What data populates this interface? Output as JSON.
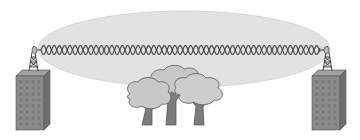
{
  "diagram": {
    "title": "",
    "colors": {
      "background": "#ffffff",
      "fresnel_zone": "#e2e2e2",
      "fresnel_edge": "#d4d4d4",
      "signal_wave": "#4a4a4a",
      "building_front": "#8a8a8a",
      "building_side": "#6e6e6e",
      "building_window": "#7a7a7a",
      "tower": "#3a3a3a",
      "tree_canopy": "#c8c8c8",
      "tree_outline": "#6a6a6a",
      "tree_trunk": "#7c7c7c"
    },
    "elements": [
      {
        "id": "left-building",
        "type": "building-with-tower"
      },
      {
        "id": "right-building",
        "type": "building-with-tower"
      },
      {
        "id": "fresnel-zone",
        "type": "ellipse"
      },
      {
        "id": "signal-path",
        "type": "double-sine-wave"
      },
      {
        "id": "trees",
        "type": "tree-cluster",
        "count": 3
      }
    ]
  }
}
